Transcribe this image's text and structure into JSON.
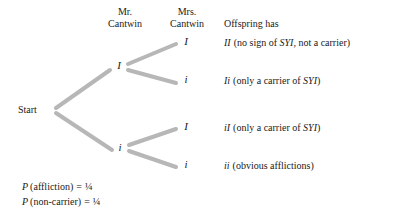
{
  "headers": {
    "father": "Mr.\nCantwin",
    "mother": "Mrs.\nCantwin",
    "offspring": "Offspring has"
  },
  "start": {
    "label": "Start"
  },
  "nodes": {
    "father_alleles": [
      {
        "id": "gen1-I",
        "label": "I"
      },
      {
        "id": "gen1-i",
        "label": "i"
      }
    ],
    "mother_alleles": [
      {
        "id": "leaf-1",
        "label": "I"
      },
      {
        "id": "leaf-2",
        "label": "i"
      },
      {
        "id": "leaf-3",
        "label": "I"
      },
      {
        "id": "leaf-4",
        "label": "i"
      }
    ]
  },
  "outcomes": [
    {
      "genotype": "II",
      "open_paren": "(no sign of ",
      "gene": "SYI",
      "close_text": ", not a carrier)"
    },
    {
      "genotype": "Ii",
      "open_paren": "(only a carrier of ",
      "gene": "SYI",
      "close_text": ")"
    },
    {
      "genotype": "iI",
      "open_paren": "(only a carrier of ",
      "gene": "SYI",
      "close_text": ")"
    },
    {
      "genotype": "ii",
      "open_paren": "(obvious afflictions)",
      "gene": "",
      "close_text": ""
    }
  ],
  "probabilities": [
    {
      "symbol": "P",
      "event": "(affliction)",
      "equals": "=",
      "value": "¼"
    },
    {
      "symbol": "P",
      "event": "(non-carrier)",
      "equals": "=",
      "value": "¼"
    }
  ],
  "colors": {
    "branch": "#b7b7b7",
    "text": "#1a1a1a",
    "background": "#ffffff"
  }
}
